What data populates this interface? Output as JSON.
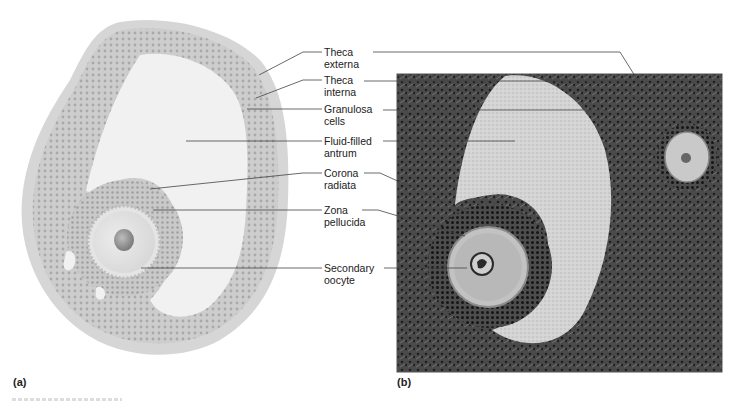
{
  "figure": {
    "panels": [
      {
        "id": "a",
        "tag": "(a)",
        "kind": "illustration",
        "subject": "secondary (antral) ovarian follicle drawing"
      },
      {
        "id": "b",
        "tag": "(b)",
        "kind": "micrograph",
        "subject": "light micrograph of secondary follicle"
      }
    ],
    "labels": [
      {
        "id": "theca-externa",
        "text": "Theca\nexterna"
      },
      {
        "id": "theca-interna",
        "text": "Theca\ninterna"
      },
      {
        "id": "granulosa-cells",
        "text": "Granulosa\ncells"
      },
      {
        "id": "fluid-filled-antrum",
        "text": "Fluid-filled\nantrum"
      },
      {
        "id": "corona-radiata",
        "text": "Corona\nradiata"
      },
      {
        "id": "zona-pellucida",
        "text": "Zona\npellucida"
      },
      {
        "id": "secondary-oocyte",
        "text": "Secondary\noocyte"
      }
    ],
    "colors": {
      "illustration_outer": "#d4d4d4",
      "illustration_granulosa": "#c6c6c6",
      "antrum": "#f2f2f2",
      "micro_dark": "#3a3a3a",
      "micro_antrum": "#cfcfcf",
      "leader_line": "#444444"
    }
  }
}
